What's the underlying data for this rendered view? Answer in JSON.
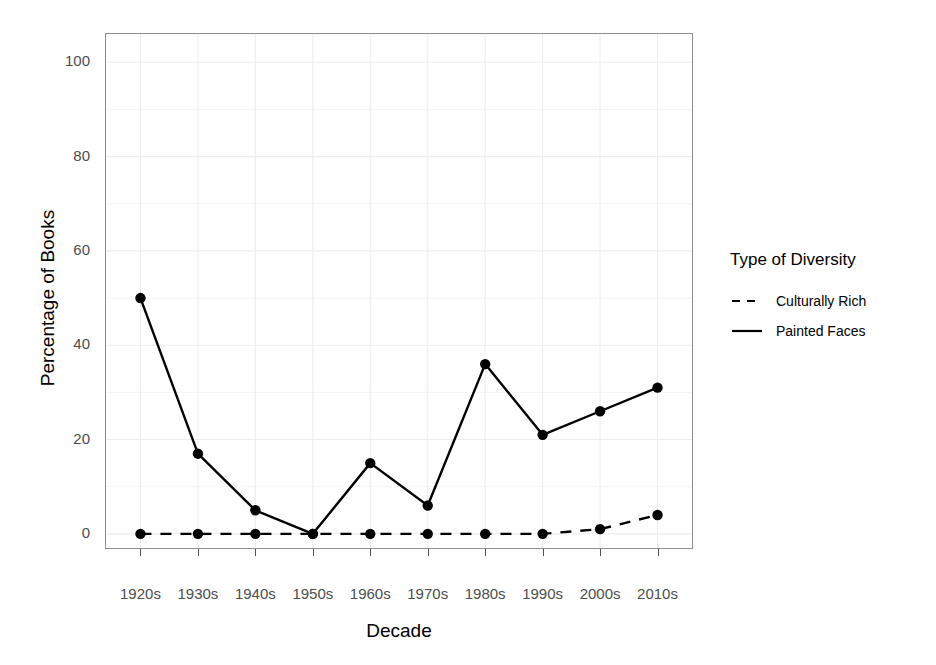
{
  "chart_data": {
    "type": "line",
    "title": "",
    "xlabel": "Decade",
    "ylabel": "Percentage of Books",
    "categories": [
      "1920s",
      "1930s",
      "1940s",
      "1950s",
      "1960s",
      "1970s",
      "1980s",
      "1990s",
      "2000s",
      "2010s"
    ],
    "series": [
      {
        "name": "Culturally Rich",
        "style": "dashed",
        "color": "#000000",
        "values": [
          0,
          0,
          0,
          0,
          0,
          0,
          0,
          0,
          1,
          4
        ]
      },
      {
        "name": "Painted Faces",
        "style": "solid",
        "color": "#000000",
        "values": [
          50,
          17,
          5,
          0,
          15,
          6,
          36,
          21,
          26,
          31
        ]
      }
    ],
    "ylim": [
      -3,
      106
    ],
    "yticks": [
      0,
      20,
      40,
      60,
      80,
      100
    ],
    "ytick_labels": [
      "0",
      "20",
      "40",
      "60",
      "80",
      "100"
    ],
    "grid": true,
    "legend_position": "right",
    "legend_title": "Type of Diversity",
    "panel_background": "#ffffff",
    "panel_border_color": "#8c8c8c",
    "grid_color": "#ededed",
    "tick_label_color": "#4d4d4d",
    "point_marker": "filled-circle"
  }
}
